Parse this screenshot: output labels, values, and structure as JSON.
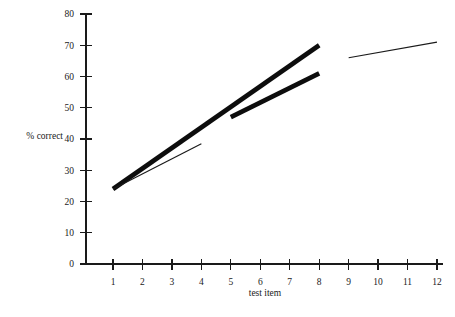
{
  "chart_data": {
    "type": "line",
    "title": "",
    "xlabel": "test item",
    "ylabel": "% correct",
    "xlim": [
      0.45,
      12.3
    ],
    "ylim": [
      0,
      80
    ],
    "grid": false,
    "legend": "none",
    "x_ticks": [
      1,
      2,
      3,
      4,
      5,
      6,
      7,
      8,
      9,
      10,
      11,
      12
    ],
    "x_tick_labels": [
      "1",
      "2",
      "3",
      "4",
      "5",
      "6",
      "7",
      "8",
      "9",
      "10",
      "11",
      "12"
    ],
    "y_ticks": [
      0,
      10,
      20,
      30,
      40,
      50,
      60,
      70,
      80
    ],
    "y_tick_labels": [
      "0",
      "10",
      "20",
      "30",
      "40",
      "50",
      "60",
      "70",
      "80"
    ],
    "series": [
      {
        "name": "thick-trend-items-1-8",
        "style": "thick",
        "x": [
          1,
          8
        ],
        "values": [
          24,
          70
        ]
      },
      {
        "name": "thick-trend-items-5-8",
        "style": "thick",
        "x": [
          5,
          8
        ],
        "values": [
          47,
          61
        ]
      },
      {
        "name": "thin-trend-items-1-4",
        "style": "thin",
        "x": [
          1,
          4
        ],
        "values": [
          24,
          38.5
        ]
      },
      {
        "name": "thin-trend-items-9-12",
        "style": "thin",
        "x": [
          9,
          12
        ],
        "values": [
          66,
          71
        ]
      }
    ]
  },
  "axes": {
    "y_label_text": "% correct",
    "x_label_text": "test item"
  },
  "colors": {
    "line": "#0d0d0d",
    "axis": "#1a1a1a",
    "background": "#ffffff"
  }
}
